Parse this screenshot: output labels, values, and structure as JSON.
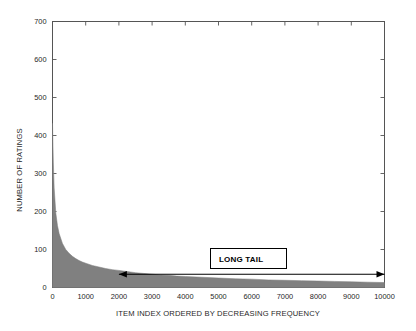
{
  "chart_data": {
    "type": "area",
    "title": "",
    "xlabel": "ITEM INDEX ORDERED BY DECREASING FREQUENCY",
    "ylabel": "NUMBER OF RATINGS",
    "xlim": [
      0,
      10000
    ],
    "ylim": [
      0,
      700
    ],
    "xticks": [
      0,
      1000,
      2000,
      3000,
      4000,
      5000,
      6000,
      7000,
      8000,
      9000,
      10000
    ],
    "yticks": [
      0,
      100,
      200,
      300,
      400,
      500,
      600,
      700
    ],
    "xtick_labels": [
      "0",
      "1000",
      "2000",
      "3000",
      "4000",
      "5000",
      "6000",
      "7000",
      "8000",
      "9000",
      "10000"
    ],
    "ytick_labels": [
      "0",
      "100",
      "200",
      "300",
      "400",
      "500",
      "600",
      "700"
    ],
    "grid": false,
    "legend": "none",
    "fill_color": "#808080",
    "series": [
      {
        "name": "ratings per item",
        "x": [
          0,
          25,
          50,
          100,
          150,
          200,
          300,
          400,
          500,
          600,
          700,
          800,
          900,
          1000,
          1200,
          1400,
          1600,
          1800,
          2000,
          2250,
          2500,
          2750,
          3000,
          3250,
          3500,
          3750,
          4000,
          4500,
          5000,
          5500,
          6000,
          6500,
          7000,
          7500,
          8000,
          8500,
          9000,
          9500,
          10000
        ],
        "values": [
          432,
          330,
          262,
          196,
          163,
          142,
          116,
          100,
          90,
          82,
          76,
          71,
          67,
          64,
          58,
          54,
          50,
          47,
          45,
          42,
          39,
          37,
          35,
          33,
          32,
          30,
          29,
          27,
          25,
          23,
          22,
          20,
          19,
          18,
          17,
          16,
          15,
          14,
          13
        ]
      }
    ],
    "annotations": [
      {
        "name": "long-tail-box",
        "label": "LONG TAIL",
        "x_range": [
          2000,
          10000
        ],
        "arrow": "double-headed",
        "arrow_y": 35
      }
    ]
  },
  "axes": {
    "y_title": "NUMBER OF RATINGS",
    "x_title": "ITEM INDEX ORDERED BY DECREASING FREQUENCY"
  },
  "annotation": {
    "long_tail_label": "LONG TAIL"
  }
}
